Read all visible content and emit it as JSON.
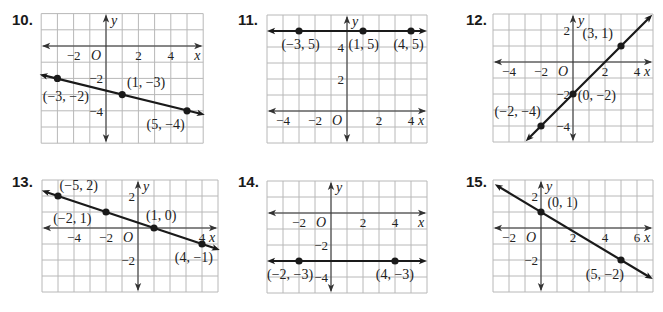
{
  "colors": {
    "grid": "#b8b8b8",
    "axis": "#333333",
    "line": "#1a1a1a",
    "text": "#222222"
  },
  "chart_data": [
    {
      "type": "line",
      "problem": "10.",
      "title": "10.",
      "xlabel": "x",
      "ylabel": "y",
      "origin_label": "O",
      "xlim": [
        -4,
        6
      ],
      "ylim": [
        -6,
        2
      ],
      "x_ticks": [
        {
          "v": -2,
          "label": "−2"
        },
        {
          "v": 2,
          "label": "2"
        },
        {
          "v": 4,
          "label": "4"
        }
      ],
      "y_ticks": [
        {
          "v": -2,
          "label": "−2"
        },
        {
          "v": -4,
          "label": "−4"
        }
      ],
      "points": [
        {
          "x": -3,
          "y": -2,
          "label": "(−3, −2)",
          "lx": -3.9,
          "ly": -3.4
        },
        {
          "x": 1,
          "y": -3,
          "label": "(1, −3)",
          "lx": 1.3,
          "ly": -2.5
        },
        {
          "x": 5,
          "y": -4,
          "label": "(5, −4)",
          "lx": 2.5,
          "ly": -5.1
        }
      ],
      "line_ends": [
        [
          -3.9,
          -1.8
        ],
        [
          5.9,
          -4.2
        ]
      ],
      "grid": true
    },
    {
      "type": "line",
      "problem": "11.",
      "title": "11.",
      "xlabel": "x",
      "ylabel": "y",
      "origin_label": "O",
      "xlim": [
        -5,
        5
      ],
      "ylim": [
        -2,
        6
      ],
      "x_ticks": [
        {
          "v": -4,
          "label": "−4"
        },
        {
          "v": -2,
          "label": "−2"
        },
        {
          "v": 2,
          "label": "2"
        },
        {
          "v": 4,
          "label": "4"
        }
      ],
      "y_ticks": [
        {
          "v": 4,
          "label": "4"
        },
        {
          "v": 2,
          "label": "2"
        }
      ],
      "points": [
        {
          "x": -3,
          "y": 5,
          "label": "(−3, 5)",
          "lx": -4.1,
          "ly": 3.9
        },
        {
          "x": 1,
          "y": 5,
          "label": "(1, 5)",
          "lx": 0.1,
          "ly": 3.9
        },
        {
          "x": 4,
          "y": 5,
          "label": "(4, 5)",
          "lx": 2.9,
          "ly": 3.9
        }
      ],
      "line_ends": [
        [
          -4.8,
          5
        ],
        [
          4.8,
          5
        ]
      ],
      "grid": true
    },
    {
      "type": "line",
      "problem": "12.",
      "title": "12.",
      "xlabel": "x",
      "ylabel": "y",
      "origin_label": "O",
      "xlim": [
        -5,
        5
      ],
      "ylim": [
        -5,
        3
      ],
      "x_ticks": [
        {
          "v": -4,
          "label": "−4"
        },
        {
          "v": -2,
          "label": "−2"
        },
        {
          "v": 2,
          "label": "2"
        },
        {
          "v": 4,
          "label": "4"
        }
      ],
      "y_ticks": [
        {
          "v": 2,
          "label": "2"
        },
        {
          "v": -2,
          "label": "−2"
        },
        {
          "v": -4,
          "label": "−4"
        }
      ],
      "points": [
        {
          "x": 3,
          "y": 1,
          "label": "(3, 1)",
          "lx": 0.6,
          "ly": 1.5
        },
        {
          "x": 0,
          "y": -2,
          "label": "(0, −2)",
          "lx": 0.3,
          "ly": -2.4
        },
        {
          "x": -2,
          "y": -4,
          "label": "(−2, −4)",
          "lx": -4.9,
          "ly": -3.4
        }
      ],
      "line_ends": [
        [
          -2.8,
          -4.8
        ],
        [
          4.8,
          2.8
        ]
      ],
      "grid": true
    },
    {
      "type": "line",
      "problem": "13.",
      "title": "13.",
      "xlabel": "x",
      "ylabel": "y",
      "origin_label": "O",
      "xlim": [
        -6,
        5
      ],
      "ylim": [
        -4,
        3
      ],
      "x_ticks": [
        {
          "v": -4,
          "label": "−4"
        },
        {
          "v": -2,
          "label": "−2"
        },
        {
          "v": 4,
          "label": "4"
        }
      ],
      "y_ticks": [
        {
          "v": 2,
          "label": "2"
        },
        {
          "v": -2,
          "label": "−2"
        }
      ],
      "points": [
        {
          "x": -5,
          "y": 2,
          "label": "(−5, 2)",
          "lx": -4.9,
          "ly": 2.4
        },
        {
          "x": -2,
          "y": 1,
          "label": "(−2, 1)",
          "lx": -5.3,
          "ly": 0.3
        },
        {
          "x": 1,
          "y": 0,
          "label": "(1, 0)",
          "lx": 0.5,
          "ly": 0.5
        },
        {
          "x": 4,
          "y": -1,
          "label": "(4, −1)",
          "lx": 2.3,
          "ly": -2.1
        }
      ],
      "line_ends": [
        [
          -5.8,
          2.27
        ],
        [
          4.9,
          -1.3
        ]
      ],
      "grid": true
    },
    {
      "type": "line",
      "problem": "14.",
      "title": "14.",
      "xlabel": "x",
      "ylabel": "y",
      "origin_label": "O",
      "xlim": [
        -4,
        6
      ],
      "ylim": [
        -5,
        2
      ],
      "x_ticks": [
        {
          "v": -2,
          "label": "−2"
        },
        {
          "v": 2,
          "label": "2"
        },
        {
          "v": 4,
          "label": "4"
        }
      ],
      "y_ticks": [
        {
          "v": -2,
          "label": "−2"
        },
        {
          "v": -4,
          "label": "−4"
        }
      ],
      "points": [
        {
          "x": -2,
          "y": -3,
          "label": "(−2, −3)",
          "lx": -4.0,
          "ly": -4.1
        },
        {
          "x": 4,
          "y": -3,
          "label": "(4, −3)",
          "lx": 2.8,
          "ly": -4.1
        }
      ],
      "line_ends": [
        [
          -3.8,
          -3
        ],
        [
          5.8,
          -3
        ]
      ],
      "grid": true
    },
    {
      "type": "line",
      "problem": "15.",
      "title": "15.",
      "xlabel": "x",
      "ylabel": "y",
      "origin_label": "O",
      "xlim": [
        -3,
        7
      ],
      "ylim": [
        -4,
        3
      ],
      "x_ticks": [
        {
          "v": -2,
          "label": "−2"
        },
        {
          "v": 2,
          "label": "2"
        },
        {
          "v": 4,
          "label": "4"
        },
        {
          "v": 6,
          "label": "6"
        }
      ],
      "y_ticks": [
        {
          "v": 2,
          "label": "2"
        },
        {
          "v": -2,
          "label": "−2"
        }
      ],
      "points": [
        {
          "x": 0,
          "y": 1,
          "label": "(0, 1)",
          "lx": 0.4,
          "ly": 1.3
        },
        {
          "x": 5,
          "y": -2,
          "label": "(5, −2)",
          "lx": 2.8,
          "ly": -3.2
        }
      ],
      "line_ends": [
        [
          -2.7,
          2.62
        ],
        [
          6.8,
          -3.08
        ]
      ],
      "grid": true
    }
  ]
}
